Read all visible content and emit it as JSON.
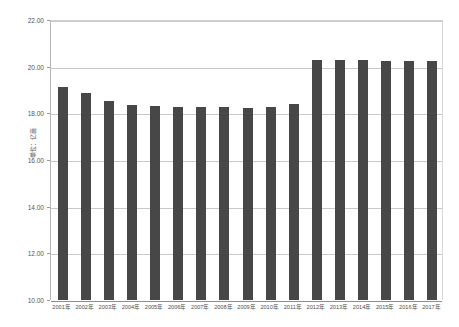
{
  "chart_data": {
    "type": "bar",
    "title": "",
    "subtitle": "",
    "xlabel": "",
    "ylabel": "单位：亿亩",
    "ylim": [
      10.0,
      22.0
    ],
    "y_ticks": [
      "10.00",
      "12.00",
      "14.00",
      "16.00",
      "18.00",
      "20.00",
      "22.00"
    ],
    "y_tick_values": [
      10.0,
      12.0,
      14.0,
      16.0,
      18.0,
      20.0,
      22.0
    ],
    "grid": true,
    "legend": false,
    "legend_position": "none",
    "bar_color": "#474747",
    "gridline_color": "#c9c9c9",
    "axis_color": "#8d8d8d",
    "categories": [
      "2001年",
      "2002年",
      "2003年",
      "2004年",
      "2005年",
      "2006年",
      "2007年",
      "2008年",
      "2009年",
      "2010年",
      "2011年",
      "2012年",
      "2013年",
      "2014年",
      "2015年",
      "2016年",
      "2017年"
    ],
    "values": [
      19.14,
      18.89,
      18.51,
      18.37,
      18.31,
      18.27,
      18.26,
      18.26,
      18.25,
      18.26,
      18.38,
      20.27,
      20.27,
      20.27,
      20.25,
      20.24,
      20.23
    ]
  }
}
